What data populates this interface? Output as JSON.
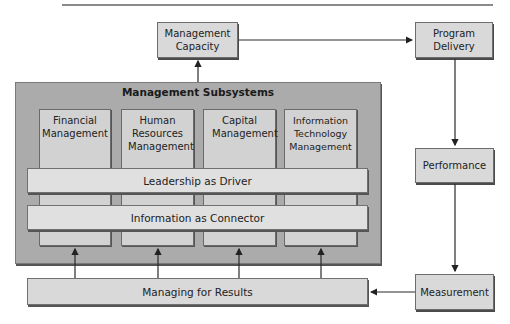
{
  "diagram": {
    "nodes": {
      "management_capacity": "Management Capacity",
      "program_delivery": "Program Delivery",
      "performance": "Performance",
      "measurement": "Measurement",
      "managing_for_results": "Managing for Results"
    },
    "subsystems": {
      "title": "Management Subsystems",
      "columns": [
        "Financial Management",
        "Human Resources Management",
        "Capital Management",
        "Information Technology Management"
      ],
      "bars": [
        "Leadership as Driver",
        "Information as Connector"
      ]
    },
    "edges": [
      {
        "from": "Management Subsystems",
        "to": "Management Capacity"
      },
      {
        "from": "Management Capacity",
        "to": "Program Delivery"
      },
      {
        "from": "Program Delivery",
        "to": "Performance"
      },
      {
        "from": "Performance",
        "to": "Measurement"
      },
      {
        "from": "Measurement",
        "to": "Managing for Results"
      },
      {
        "from": "Managing for Results",
        "to": "Financial Management"
      },
      {
        "from": "Managing for Results",
        "to": "Human Resources Management"
      },
      {
        "from": "Managing for Results",
        "to": "Capital Management"
      },
      {
        "from": "Managing for Results",
        "to": "Information Technology Management"
      }
    ],
    "colors": {
      "box_fill": "#d9d9d9",
      "outer_fill": "#ababab",
      "bar_fill": "#e0e0e0",
      "line": "#333333"
    }
  }
}
